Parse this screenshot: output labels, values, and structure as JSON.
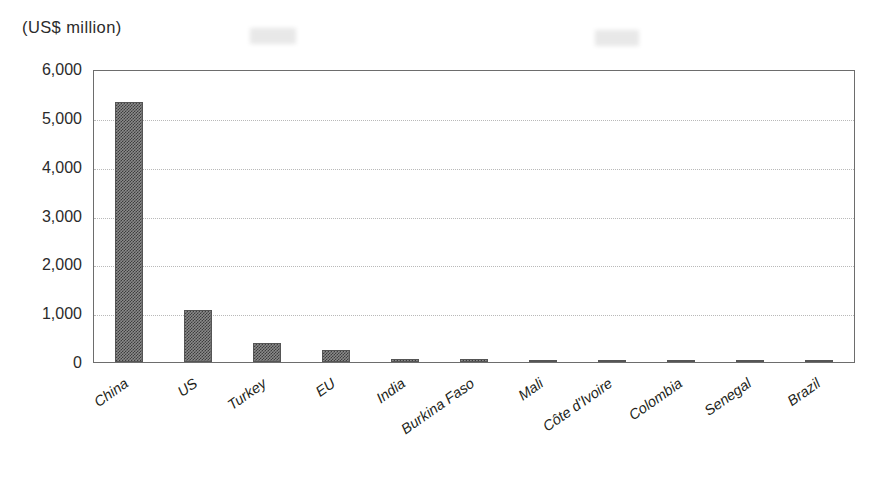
{
  "chart_data": {
    "type": "bar",
    "title": "",
    "unit_label": "(US$ million)",
    "xlabel": "",
    "ylabel": "(US$ million)",
    "ylim": [
      0,
      6000
    ],
    "ytick_step": 1000,
    "grid": true,
    "legend": "none",
    "bar_color": "#6e6e6e",
    "categories": [
      "China",
      "US",
      "Turkey",
      "EU",
      "India",
      "Burkina Faso",
      "Mali",
      "Côte d'Ivoire",
      "Colombia",
      "Senegal",
      "Brazil"
    ],
    "values": [
      5320,
      1060,
      380,
      255,
      60,
      65,
      20,
      5,
      3,
      2,
      1
    ],
    "ytick_labels": [
      "0",
      "1,000",
      "2,000",
      "3,000",
      "4,000",
      "5,000",
      "6,000"
    ],
    "ytick_values": [
      0,
      1000,
      2000,
      3000,
      4000,
      5000,
      6000
    ]
  }
}
